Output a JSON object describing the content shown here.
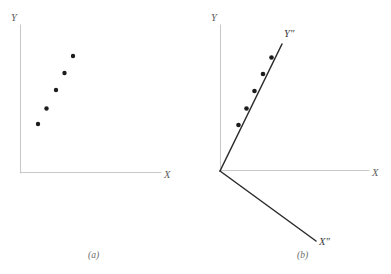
{
  "figure": {
    "background_color": "#ffffff",
    "width": 391,
    "height": 274,
    "axis_color": "#c9c9c9",
    "rotated_axis_color": "#2b2b2b",
    "point_color": "#1c1c1c",
    "label_color": "#5d5d5d"
  },
  "chart_data": {
    "type": "scatter",
    "title": "",
    "subtitle": "",
    "panels": [
      {
        "id": "a",
        "caption": "(a)",
        "xlabel": "X",
        "ylabel": "Y",
        "grid": false,
        "legend": "none",
        "axis_ticks": [],
        "xlim": [
          0,
          10
        ],
        "ylim": [
          0,
          10
        ],
        "series": [
          {
            "name": "observations",
            "marker": "filled-circle",
            "x": [
              1.3,
              1.9,
              2.6,
              3.2,
              3.8
            ],
            "y": [
              3.3,
              4.3,
              5.6,
              6.8,
              7.9
            ]
          }
        ]
      },
      {
        "id": "b",
        "caption": "(b)",
        "xlabel": "X",
        "ylabel": "Y",
        "rotated_xlabel": "X″",
        "rotated_ylabel": "Y″",
        "grid": false,
        "legend": "none",
        "axis_ticks": [],
        "xlim": [
          0,
          10
        ],
        "ylim": [
          0,
          10
        ],
        "rotation_note": "principal axes rotated; points collinear along Y″",
        "series": [
          {
            "name": "observations",
            "marker": "filled-circle",
            "x": [
              1.2,
              1.75,
              2.25,
              2.9,
              3.5
            ],
            "y": [
              3.15,
              4.3,
              5.45,
              6.55,
              7.45
            ]
          }
        ]
      }
    ]
  },
  "panel_a": {
    "y_axis_label": "Y",
    "x_axis_label": "X",
    "caption": "(a)",
    "points": [
      {
        "cx": 38,
        "cy": 124,
        "r": 2.2
      },
      {
        "cx": 46.5,
        "cy": 108.5,
        "r": 2.2
      },
      {
        "cx": 56,
        "cy": 90,
        "r": 2.2
      },
      {
        "cx": 64.5,
        "cy": 73,
        "r": 2.2
      },
      {
        "cx": 73,
        "cy": 56,
        "r": 2.2
      }
    ],
    "y_axis": {
      "x1": 20.5,
      "y1": 25,
      "x2": 20.5,
      "y2": 173
    },
    "x_axis": {
      "x1": 20.5,
      "y1": 172.5,
      "x2": 161,
      "y2": 172.5
    },
    "y_label_pos": {
      "x": 11,
      "y": 21
    },
    "x_label_pos": {
      "x": 164,
      "y": 178
    },
    "caption_pos": {
      "x": 88,
      "y": 258
    }
  },
  "panel_b": {
    "y_axis_label": "Y",
    "x_axis_label": "X",
    "rotated_y_axis_label": "Y″",
    "rotated_x_axis_label": "X″",
    "caption": "(b)",
    "points": [
      {
        "cx": 238.5,
        "cy": 125,
        "r": 2.3
      },
      {
        "cx": 246.5,
        "cy": 108.5,
        "r": 2.3
      },
      {
        "cx": 254.5,
        "cy": 91,
        "r": 2.3
      },
      {
        "cx": 263,
        "cy": 74,
        "r": 2.3
      },
      {
        "cx": 271.5,
        "cy": 57.5,
        "r": 2.3
      }
    ],
    "y_axis": {
      "x1": 220.5,
      "y1": 25,
      "x2": 220.5,
      "y2": 171
    },
    "x_axis": {
      "x1": 220.5,
      "y1": 170.5,
      "x2": 369,
      "y2": 170.5
    },
    "rotated_y_axis": {
      "x1": 220,
      "y1": 171,
      "x2": 282,
      "y2": 44
    },
    "rotated_x_axis": {
      "x1": 220,
      "y1": 171,
      "x2": 316,
      "y2": 241
    },
    "y_label_pos": {
      "x": 211,
      "y": 21
    },
    "x_label_pos": {
      "x": 372,
      "y": 176
    },
    "rotated_y_label_pos": {
      "x": 284,
      "y": 37
    },
    "rotated_x_label_pos": {
      "x": 319,
      "y": 245
    },
    "caption_pos": {
      "x": 297,
      "y": 258
    }
  }
}
